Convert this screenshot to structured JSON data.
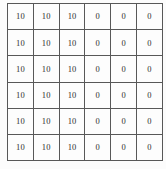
{
  "chart_data": {
    "type": "table",
    "title": "",
    "xlabel": "",
    "ylabel": "",
    "rows": 6,
    "columns": 6,
    "grid": true,
    "legend": "none",
    "cells": [
      [
        "10",
        "10",
        "10",
        "0",
        "0",
        "0"
      ],
      [
        "10",
        "10",
        "10",
        "0",
        "0",
        "0"
      ],
      [
        "10",
        "10",
        "10",
        "0",
        "0",
        "0"
      ],
      [
        "10",
        "10",
        "10",
        "0",
        "0",
        "0"
      ],
      [
        "10",
        "10",
        "10",
        "0",
        "0",
        "0"
      ],
      [
        "10",
        "10",
        "10",
        "0",
        "0",
        "0"
      ]
    ],
    "values": [
      [
        10,
        10,
        10,
        0,
        0,
        0
      ],
      [
        10,
        10,
        10,
        0,
        0,
        0
      ],
      [
        10,
        10,
        10,
        0,
        0,
        0
      ],
      [
        10,
        10,
        10,
        0,
        0,
        0
      ],
      [
        10,
        10,
        10,
        0,
        0,
        0
      ],
      [
        10,
        10,
        10,
        0,
        0,
        0
      ]
    ],
    "colors": {
      "background": "#fcfcfc",
      "cell_background": "#fdfdfd",
      "outer_border": "#4a4a4a",
      "grid_line": "#585858",
      "text": "#2e2e2e"
    }
  }
}
